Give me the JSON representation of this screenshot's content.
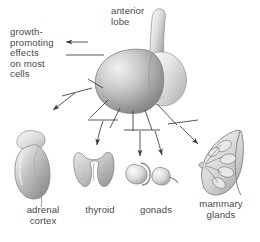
{
  "figure": {
    "kind": "anatomical-diagram",
    "background_color": "#ffffff",
    "ink_color": "#4a4a4a",
    "labels": {
      "anterior_lobe": "anterior\nlobe",
      "growth_effects": "growth-\npromoting\neffects\non most\ncells",
      "adrenal_cortex": "adrenal\ncortex",
      "thyroid": "thyroid",
      "gonads": "gonads",
      "mammary_glands": "mammary\nglands"
    },
    "targets": [
      {
        "name": "adrenal cortex",
        "label": "adrenal\ncortex",
        "shape": "kidney-with-adrenal-cap"
      },
      {
        "name": "thyroid",
        "label": "thyroid",
        "shape": "butterfly-lobes"
      },
      {
        "name": "gonads",
        "label": "gonads",
        "shape": "testis-and-ovary-pair"
      },
      {
        "name": "mammary glands",
        "label": "mammary\nglands",
        "shape": "breast-cross-section"
      }
    ],
    "arrow_count": 5,
    "arrow_targets": [
      "growth-promoting effects on most cells",
      "adrenal cortex",
      "thyroid",
      "gonads-left",
      "gonads-right",
      "mammary glands"
    ]
  }
}
